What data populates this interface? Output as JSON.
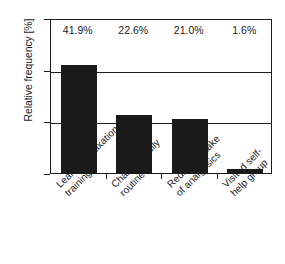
{
  "chart_data": {
    "type": "bar",
    "title": "",
    "xlabel": "",
    "ylabel": "Relative frequency [%]",
    "ylim": [
      0,
      60
    ],
    "yticks": [
      "0",
      "20",
      "40",
      "60"
    ],
    "ytick_values": [
      0,
      20,
      40,
      60
    ],
    "gridlines": [
      20,
      40
    ],
    "grid": true,
    "legend": "none",
    "bar_color": "#1a1a1a",
    "categories": [
      "Learned relaxation training",
      "Changed daily routine",
      "Reduced intake of analgesics",
      "Visited self- help group"
    ],
    "category_lines": [
      [
        "Learned relaxation",
        "training"
      ],
      [
        "Changed daily",
        "routine"
      ],
      [
        "Reduced intake",
        "of analgesics"
      ],
      [
        "Visited self-",
        "help group"
      ]
    ],
    "values": [
      41.9,
      22.6,
      21.0,
      1.6
    ],
    "value_labels": [
      "41.9%",
      "22.6%",
      "21.0%",
      "1.6%"
    ]
  }
}
